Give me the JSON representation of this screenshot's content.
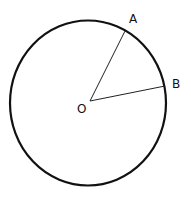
{
  "diagram": {
    "type": "circle-sectors",
    "colors": {
      "stroke": "#111111",
      "background": "#ffffff"
    },
    "circle": {
      "cx": 88,
      "cy": 103,
      "rx": 78,
      "ry": 82
    },
    "center": {
      "label": "O",
      "x": 90,
      "y": 101
    },
    "points": [
      {
        "label": "A",
        "x": 125,
        "y": 31
      },
      {
        "label": "B",
        "x": 165,
        "y": 86
      }
    ]
  }
}
